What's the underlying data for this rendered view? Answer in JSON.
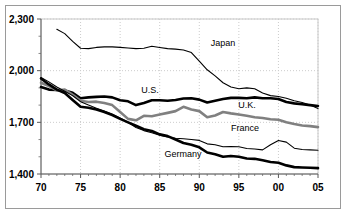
{
  "chart_data": {
    "type": "line",
    "title": "",
    "subtitle": "",
    "xlabel": "",
    "ylabel": "",
    "xlim": [
      70,
      105
    ],
    "ylim": [
      1400,
      2300
    ],
    "x_tick_labels": [
      "70",
      "75",
      "80",
      "85",
      "90",
      "95",
      "00",
      "05"
    ],
    "x_tick_values": [
      70,
      75,
      80,
      85,
      90,
      95,
      100,
      105
    ],
    "y_tick_labels": [
      "1,400",
      "1,700",
      "2,000",
      "2,300"
    ],
    "y_tick_values": [
      1400,
      1700,
      2000,
      2300
    ],
    "y_minor_ticks": [
      1500,
      1600,
      1800,
      1900,
      2100,
      2200
    ],
    "grid": true,
    "grid_style": "dotted",
    "grid_color": "#cccccc",
    "legend_position": "inline-annotations",
    "series": [
      {
        "name": "Japan",
        "color": "#000000",
        "width": 1.1,
        "label_x": 223,
        "label_y": 46,
        "x": [
          72,
          73,
          74,
          75,
          76,
          77,
          78,
          79,
          80,
          81,
          82,
          83,
          84,
          85,
          86,
          87,
          88,
          89,
          90,
          91,
          92,
          93,
          94,
          95,
          96,
          97,
          98,
          99,
          100,
          101,
          102,
          103,
          104,
          105
        ],
        "values": [
          2240,
          2215,
          2170,
          2130,
          2128,
          2135,
          2138,
          2138,
          2135,
          2132,
          2128,
          2130,
          2142,
          2135,
          2128,
          2125,
          2120,
          2105,
          2055,
          2005,
          1970,
          1930,
          1905,
          1895,
          1900,
          1895,
          1870,
          1855,
          1850,
          1840,
          1825,
          1815,
          1800,
          1780
        ]
      },
      {
        "name": "U.S.",
        "color": "#000000",
        "width": 2.6,
        "label_x": 150,
        "label_y": 93,
        "x": [
          70,
          71,
          72,
          73,
          74,
          75,
          76,
          77,
          78,
          79,
          80,
          81,
          82,
          83,
          84,
          85,
          86,
          87,
          88,
          89,
          90,
          91,
          92,
          93,
          94,
          95,
          96,
          97,
          98,
          99,
          100,
          101,
          102,
          103,
          104,
          105
        ],
        "values": [
          1905,
          1890,
          1888,
          1885,
          1872,
          1840,
          1845,
          1848,
          1850,
          1845,
          1828,
          1822,
          1800,
          1812,
          1828,
          1828,
          1825,
          1830,
          1838,
          1840,
          1832,
          1815,
          1825,
          1835,
          1842,
          1842,
          1840,
          1845,
          1840,
          1840,
          1835,
          1818,
          1810,
          1805,
          1800,
          1795
        ]
      },
      {
        "name": "U.K.",
        "color": "#808080",
        "width": 2.6,
        "label_x": 247,
        "label_y": 108,
        "x": [
          70,
          71,
          72,
          73,
          74,
          75,
          76,
          77,
          78,
          79,
          80,
          81,
          82,
          83,
          84,
          85,
          86,
          87,
          88,
          89,
          90,
          91,
          92,
          93,
          94,
          95,
          96,
          97,
          98,
          99,
          100,
          101,
          102,
          103,
          104,
          105
        ],
        "values": [
          1930,
          1910,
          1885,
          1890,
          1860,
          1825,
          1818,
          1820,
          1812,
          1800,
          1760,
          1720,
          1712,
          1738,
          1735,
          1745,
          1755,
          1765,
          1790,
          1775,
          1765,
          1730,
          1740,
          1760,
          1752,
          1745,
          1738,
          1730,
          1725,
          1718,
          1715,
          1700,
          1690,
          1682,
          1678,
          1672
        ]
      },
      {
        "name": "France",
        "color": "#000000",
        "width": 1.1,
        "label_x": 245,
        "label_y": 131,
        "x": [
          70,
          71,
          72,
          73,
          74,
          75,
          76,
          77,
          78,
          79,
          80,
          81,
          82,
          83,
          84,
          85,
          86,
          87,
          88,
          89,
          90,
          91,
          92,
          93,
          94,
          95,
          96,
          97,
          98,
          99,
          100,
          101,
          102,
          103,
          104,
          105
        ],
        "values": [
          1960,
          1935,
          1905,
          1880,
          1855,
          1820,
          1800,
          1782,
          1765,
          1748,
          1725,
          1700,
          1670,
          1652,
          1640,
          1625,
          1615,
          1608,
          1605,
          1600,
          1595,
          1575,
          1570,
          1558,
          1560,
          1558,
          1548,
          1545,
          1540,
          1570,
          1595,
          1585,
          1550,
          1542,
          1540,
          1538
        ]
      },
      {
        "name": "Germany",
        "color": "#000000",
        "width": 2.6,
        "label_x": 183,
        "label_y": 157,
        "x": [
          70,
          71,
          72,
          73,
          74,
          75,
          76,
          77,
          78,
          79,
          80,
          81,
          82,
          83,
          84,
          85,
          86,
          87,
          88,
          89,
          90,
          91,
          92,
          93,
          94,
          95,
          96,
          97,
          98,
          99,
          100,
          101,
          102,
          103,
          104,
          105
        ],
        "values": [
          1955,
          1920,
          1890,
          1870,
          1830,
          1790,
          1785,
          1775,
          1760,
          1742,
          1720,
          1700,
          1680,
          1660,
          1650,
          1630,
          1620,
          1600,
          1580,
          1570,
          1555,
          1525,
          1515,
          1500,
          1505,
          1500,
          1490,
          1488,
          1480,
          1470,
          1465,
          1450,
          1440,
          1438,
          1436,
          1434
        ]
      }
    ]
  },
  "axis": {
    "y_ticks": [
      "2,300",
      "2,000",
      "1,700",
      "1,400"
    ],
    "x_ticks": [
      "70",
      "75",
      "80",
      "85",
      "90",
      "95",
      "00",
      "05"
    ]
  },
  "labels": {
    "japan": "Japan",
    "us": "U.S.",
    "uk": "U.K.",
    "france": "France",
    "germany": "Germany"
  }
}
